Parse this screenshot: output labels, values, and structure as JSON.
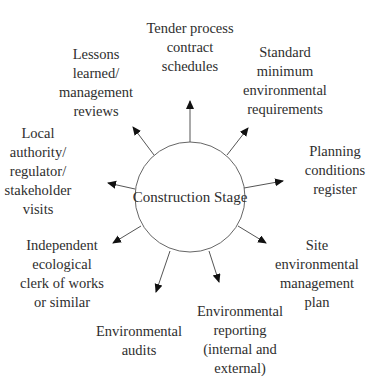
{
  "diagram": {
    "center": {
      "label": "Construction Stage",
      "cx": 190,
      "cy": 197,
      "r": 55
    },
    "nodes": [
      {
        "id": "tender",
        "lines": [
          "Tender process",
          "contract",
          "schedules"
        ],
        "x": 190,
        "top": 19,
        "arrow": {
          "x1": 190,
          "y1": 142,
          "x2": 190,
          "y2": 101
        }
      },
      {
        "id": "standard",
        "lines": [
          "Standard",
          "minimum",
          "environmental",
          "requirements"
        ],
        "x": 285,
        "top": 43,
        "arrow": {
          "x1": 227,
          "y1": 155,
          "x2": 248,
          "y2": 128
        }
      },
      {
        "id": "planning",
        "lines": [
          "Planning",
          "conditions",
          "register"
        ],
        "x": 335,
        "top": 142,
        "arrow": {
          "x1": 244,
          "y1": 188,
          "x2": 283,
          "y2": 181
        }
      },
      {
        "id": "site",
        "lines": [
          "Site",
          "environmental",
          "management",
          "plan"
        ],
        "x": 317,
        "top": 236,
        "arrow": {
          "x1": 238,
          "y1": 226,
          "x2": 266,
          "y2": 243
        }
      },
      {
        "id": "reporting",
        "lines": [
          "Environmental",
          "reporting",
          "(internal and",
          "external)"
        ],
        "x": 240,
        "top": 302,
        "arrow": {
          "x1": 209,
          "y1": 251,
          "x2": 219,
          "y2": 282
        }
      },
      {
        "id": "audits",
        "lines": [
          "Environmental",
          "audits"
        ],
        "x": 139,
        "top": 322,
        "arrow": {
          "x1": 170,
          "y1": 251,
          "x2": 156,
          "y2": 292
        }
      },
      {
        "id": "independent",
        "lines": [
          "Independent",
          "ecological",
          "clerk of works",
          "or similar"
        ],
        "x": 62,
        "top": 236,
        "arrow": {
          "x1": 141,
          "y1": 226,
          "x2": 113,
          "y2": 243
        }
      },
      {
        "id": "local",
        "lines": [
          "Local",
          "authority/",
          "regulator/",
          "stakeholder",
          "visits"
        ],
        "x": 38,
        "top": 124,
        "arrow": {
          "x1": 135,
          "y1": 189,
          "x2": 108,
          "y2": 183
        }
      },
      {
        "id": "lessons",
        "lines": [
          "Lessons",
          "learned/",
          "management",
          "reviews"
        ],
        "x": 96,
        "top": 45,
        "arrow": {
          "x1": 154,
          "y1": 155,
          "x2": 133,
          "y2": 127
        }
      }
    ],
    "colors": {
      "line": "#555555",
      "arrowhead": "#111111",
      "circle": "#666666",
      "text": "#2e2e2e"
    }
  }
}
